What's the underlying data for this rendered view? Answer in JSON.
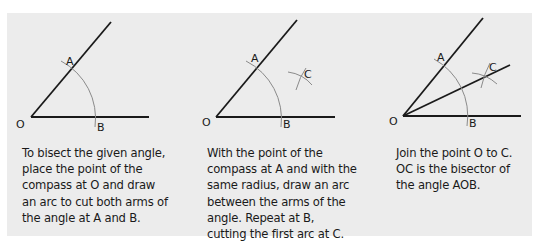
{
  "colors": {
    "panel_background": "#ececec",
    "line": "#1a1a1a",
    "arc": "#8a8a8a",
    "text": "#1a1a1a"
  },
  "steps": [
    {
      "labels": {
        "O": "O",
        "A": "A",
        "B": "B"
      },
      "text": "To bisect the given angle, place the point of the compass at O and draw an arc to cut both arms of the angle at A and B."
    },
    {
      "labels": {
        "O": "O",
        "A": "A",
        "B": "B",
        "C": "C"
      },
      "text": "With the point of the compass at A and with the same radius, draw an arc between the arms of the angle. Repeat at B, cutting the first arc at C."
    },
    {
      "labels": {
        "O": "O",
        "A": "A",
        "B": "B",
        "C": "C"
      },
      "text": "Join the point O to C. OC is the bisector of the angle AOB."
    }
  ]
}
